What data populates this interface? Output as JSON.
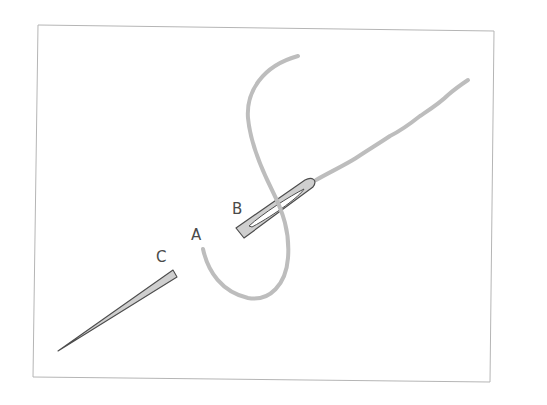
{
  "diagram": {
    "labels": {
      "a": "A",
      "b": "B",
      "c": "C"
    },
    "colors": {
      "frame": "#b5b5b5",
      "thread": "#bdbdbd",
      "needle_fill": "#cfcfcf",
      "needle_stroke": "#4d4d4d",
      "label_text": "#4a4a4a"
    }
  }
}
